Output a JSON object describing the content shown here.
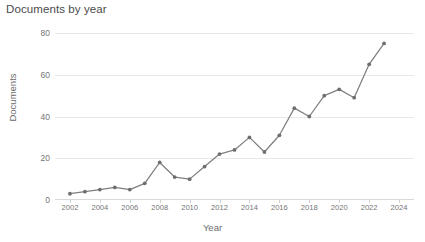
{
  "chart_data": {
    "type": "line",
    "title": "Documents by year",
    "xlabel": "Year",
    "ylabel": "Documents",
    "categories": [
      2002,
      2003,
      2004,
      2005,
      2006,
      2007,
      2008,
      2009,
      2010,
      2011,
      2012,
      2013,
      2014,
      2015,
      2016,
      2017,
      2018,
      2019,
      2020,
      2021,
      2022,
      2023
    ],
    "x": [
      2002,
      2003,
      2004,
      2005,
      2006,
      2007,
      2008,
      2009,
      2010,
      2011,
      2012,
      2013,
      2014,
      2015,
      2016,
      2017,
      2018,
      2019,
      2020,
      2021,
      2022,
      2023
    ],
    "values": [
      3,
      4,
      5,
      6,
      5,
      8,
      18,
      11,
      10,
      16,
      22,
      24,
      30,
      23,
      31,
      44,
      40,
      50,
      53,
      49,
      65,
      75
    ],
    "series": [
      {
        "name": "Documents",
        "values": [
          3,
          4,
          5,
          6,
          5,
          8,
          18,
          11,
          10,
          16,
          22,
          24,
          30,
          23,
          31,
          44,
          40,
          50,
          53,
          49,
          65,
          75
        ]
      }
    ],
    "xlim": [
      2001,
      2025
    ],
    "ylim": [
      0,
      80
    ],
    "y_ticks": [
      0,
      20,
      40,
      60,
      80
    ],
    "x_ticks": [
      2002,
      2004,
      2006,
      2008,
      2010,
      2012,
      2014,
      2016,
      2018,
      2020,
      2022,
      2024
    ],
    "grid": true,
    "legend": "none",
    "line_color": "#7f7f7f",
    "marker_color": "#6e6e6e",
    "grid_color": "#e8e8e8",
    "axis_label_color": "#6b6b6b",
    "tick_label_color": "#757575",
    "title_color": "#4a4a4a",
    "background": "#ffffff"
  }
}
